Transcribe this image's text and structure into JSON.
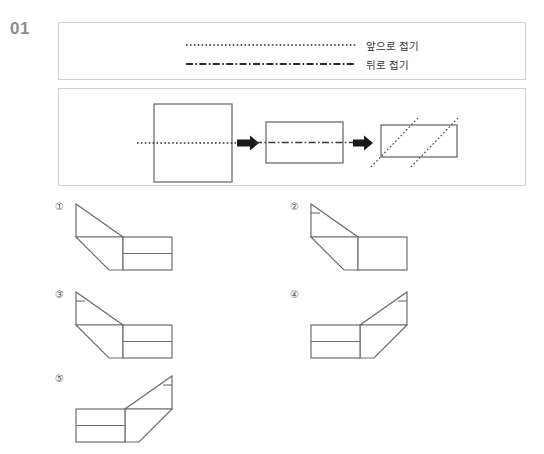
{
  "problem": {
    "number": "01",
    "type": "paper-folding"
  },
  "legend": {
    "rows": [
      {
        "line_style": "dotted",
        "label": "앞으로 접기",
        "meaning": "fold forward"
      },
      {
        "line_style": "dash-dot",
        "label": "뒤로 접기",
        "meaning": "fold backward"
      }
    ]
  },
  "sequence": {
    "steps": [
      {
        "index": 1,
        "shape": "square",
        "fold_line": "dotted",
        "fold_orientation": "horizontal-center"
      },
      {
        "index": 2,
        "shape": "rectangle",
        "fold_line": "dash-dot",
        "fold_orientation": "horizontal-center"
      },
      {
        "index": 3,
        "shape": "rectangle",
        "fold_line": "dotted",
        "fold_orientation": "two-diagonals"
      }
    ],
    "arrows": [
      {
        "direction": "right"
      },
      {
        "direction": "right"
      }
    ]
  },
  "options": [
    {
      "id": "1",
      "marker": "①",
      "divided": true,
      "orientation": "left-flap-up",
      "flap_tick": false
    },
    {
      "id": "2",
      "marker": "②",
      "divided": false,
      "orientation": "left-flap-up",
      "flap_tick": true
    },
    {
      "id": "3",
      "marker": "③",
      "divided": true,
      "orientation": "left-flap-up",
      "flap_tick": true
    },
    {
      "id": "4",
      "marker": "④",
      "divided": true,
      "orientation": "right-flap-up",
      "flap_tick": true
    },
    {
      "id": "5",
      "marker": "⑤",
      "divided": true,
      "orientation": "right-flap-up",
      "flap_tick": true
    }
  ],
  "colors": {
    "frame_border": "#cfcfcf",
    "figure_stroke": "#6e6e6e",
    "figure_stroke_dark": "#555555",
    "arrow_fill": "#1a1a1a",
    "number_gray": "#8d8d8d",
    "text": "#333333",
    "background": "#ffffff"
  }
}
